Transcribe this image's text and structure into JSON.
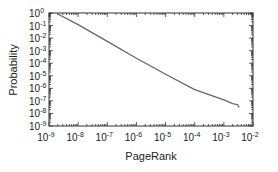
{
  "chart_data": {
    "type": "line",
    "title": "",
    "xlabel": "PageRank",
    "ylabel": "Probability",
    "xscale": "log",
    "yscale": "log",
    "xlim": [
      1e-09,
      0.01
    ],
    "ylim": [
      1e-09,
      1
    ],
    "x_tick_labels": [
      "10^-9",
      "10^-8",
      "10^-7",
      "10^-6",
      "10^-5",
      "10^-4",
      "10^-3",
      "10^-2"
    ],
    "y_tick_labels": [
      "10^0",
      "10^-1",
      "10^-2",
      "10^-3",
      "10^-4",
      "10^-5",
      "10^-6",
      "10^-7",
      "10^-8",
      "10^-9"
    ],
    "grid": false,
    "legend": null,
    "series": [
      {
        "name": "PageRank distribution",
        "color": "#666666",
        "x": [
          2e-09,
          1e-08,
          1e-07,
          1e-06,
          1e-05,
          0.0001,
          0.001,
          0.002,
          0.003,
          0.0033
        ],
        "y": [
          0.83,
          0.12,
          0.0055,
          0.00025,
          1.3e-05,
          8e-07,
          1.2e-07,
          6e-08,
          5e-08,
          3e-08
        ]
      }
    ]
  },
  "axes": {
    "x_ticks": [
      {
        "base": "10",
        "exp": "-9"
      },
      {
        "base": "10",
        "exp": "-8"
      },
      {
        "base": "10",
        "exp": "-7"
      },
      {
        "base": "10",
        "exp": "-6"
      },
      {
        "base": "10",
        "exp": "-5"
      },
      {
        "base": "10",
        "exp": "-4"
      },
      {
        "base": "10",
        "exp": "-3"
      },
      {
        "base": "10",
        "exp": "-2"
      }
    ],
    "y_ticks": [
      {
        "base": "10",
        "exp": "0"
      },
      {
        "base": "10",
        "exp": "-1"
      },
      {
        "base": "10",
        "exp": "-2"
      },
      {
        "base": "10",
        "exp": "-3"
      },
      {
        "base": "10",
        "exp": "-4"
      },
      {
        "base": "10",
        "exp": "-5"
      },
      {
        "base": "10",
        "exp": "-6"
      },
      {
        "base": "10",
        "exp": "-7"
      },
      {
        "base": "10",
        "exp": "-8"
      },
      {
        "base": "10",
        "exp": "-9"
      }
    ],
    "xlabel": "PageRank",
    "ylabel": "Probability"
  }
}
